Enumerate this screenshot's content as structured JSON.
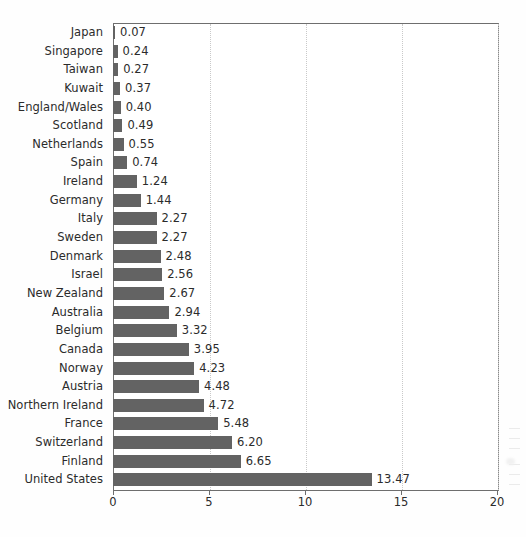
{
  "chart_data": {
    "type": "bar",
    "orientation": "horizontal",
    "title": "",
    "subtitle": "",
    "xlabel": "",
    "ylabel": "",
    "xlim": [
      0,
      20
    ],
    "x_ticks": [
      0,
      5,
      10,
      15,
      20
    ],
    "x_tick_labels": [
      "0",
      "5",
      "10",
      "15",
      "20"
    ],
    "grid": "vertical-dotted",
    "legend": "none",
    "bar_color": "#636363",
    "value_label_format": "2dp",
    "categories": [
      "Japan",
      "Singapore",
      "Taiwan",
      "Kuwait",
      "England/Wales",
      "Scotland",
      "Netherlands",
      "Spain",
      "Ireland",
      "Germany",
      "Italy",
      "Sweden",
      "Denmark",
      "Israel",
      "New Zealand",
      "Australia",
      "Belgium",
      "Canada",
      "Norway",
      "Austria",
      "Northern Ireland",
      "France",
      "Switzerland",
      "Finland",
      "United States"
    ],
    "values": [
      0.07,
      0.24,
      0.27,
      0.37,
      0.4,
      0.49,
      0.55,
      0.74,
      1.24,
      1.44,
      2.27,
      2.27,
      2.48,
      2.56,
      2.67,
      2.94,
      3.32,
      3.95,
      4.23,
      4.48,
      4.72,
      5.48,
      6.2,
      6.65,
      13.47
    ],
    "value_labels": [
      "0.07",
      "0.24",
      "0.27",
      "0.37",
      "0.40",
      "0.49",
      "0.55",
      "0.74",
      "1.24",
      "1.44",
      "2.27",
      "2.27",
      "2.48",
      "2.56",
      "2.67",
      "2.94",
      "3.32",
      "3.95",
      "4.23",
      "4.48",
      "4.72",
      "5.48",
      "6.20",
      "6.65",
      "13.47"
    ]
  }
}
